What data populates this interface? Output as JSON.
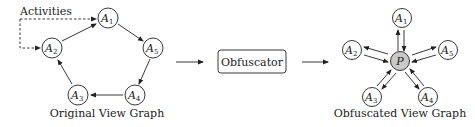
{
  "original_graph": {
    "caption": "Original View Graph",
    "annotation": "Activities",
    "nodes": [
      {
        "id": "A1",
        "letter": "A",
        "sub": "1",
        "x": 108,
        "y": 18
      },
      {
        "id": "A2",
        "letter": "A",
        "sub": "2",
        "x": 52,
        "y": 48
      },
      {
        "id": "A3",
        "letter": "A",
        "sub": "3",
        "x": 78,
        "y": 95
      },
      {
        "id": "A4",
        "letter": "A",
        "sub": "4",
        "x": 135,
        "y": 95
      },
      {
        "id": "A5",
        "letter": "A",
        "sub": "5",
        "x": 153,
        "y": 48
      }
    ],
    "edges": [
      [
        "A1",
        "A5"
      ],
      [
        "A5",
        "A4"
      ],
      [
        "A4",
        "A3"
      ],
      [
        "A3",
        "A2"
      ],
      [
        "A2",
        "A1"
      ]
    ]
  },
  "process": {
    "box_label": "Obfuscator"
  },
  "obfuscated_graph": {
    "caption": "Obfuscated View Graph",
    "center_node": {
      "id": "P",
      "label": "P",
      "x": 400,
      "y": 61,
      "fill": "#c8c8c8"
    },
    "nodes": [
      {
        "id": "A1",
        "letter": "A",
        "sub": "1",
        "x": 402,
        "y": 18
      },
      {
        "id": "A2",
        "letter": "A",
        "sub": "2",
        "x": 352,
        "y": 50
      },
      {
        "id": "A3",
        "letter": "A",
        "sub": "3",
        "x": 372,
        "y": 97
      },
      {
        "id": "A4",
        "letter": "A",
        "sub": "4",
        "x": 428,
        "y": 97
      },
      {
        "id": "A5",
        "letter": "A",
        "sub": "5",
        "x": 448,
        "y": 50
      }
    ]
  }
}
